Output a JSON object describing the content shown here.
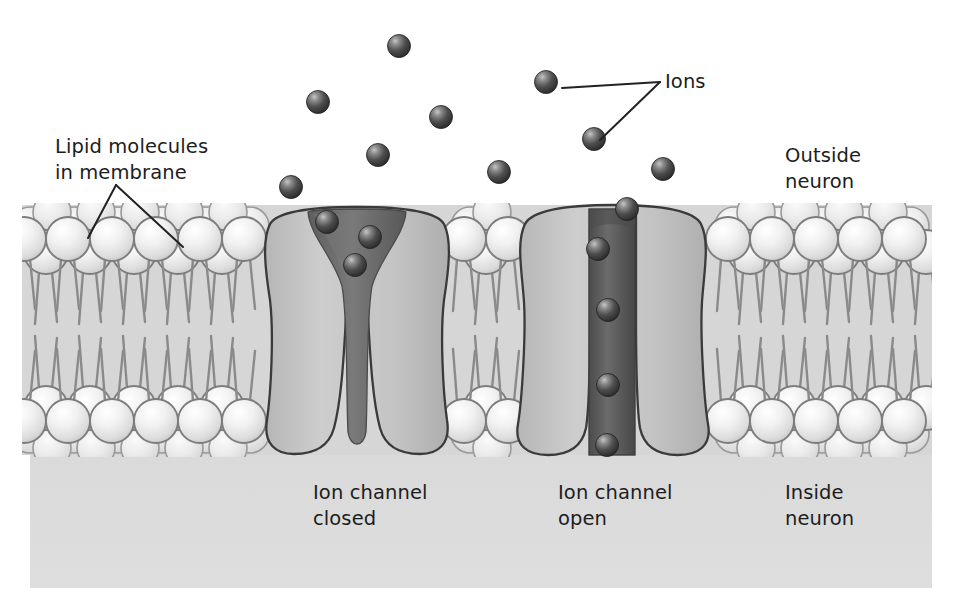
{
  "figure": {
    "canvas": {
      "width": 958,
      "height": 604
    },
    "background_color": "#ffffff"
  },
  "labels": {
    "lipid_molecules": "Lipid molecules\nin membrane",
    "ions": "Ions",
    "outside_neuron": "Outside\nneuron",
    "ion_channel_closed": "Ion channel\nclosed",
    "ion_channel_open": "Ion channel\nopen",
    "inside_neuron": "Inside\nneuron"
  },
  "colors": {
    "background": "#ffffff",
    "outside_region": "#ffffff",
    "inside_region": "#dcdcdc",
    "membrane_interior": "#d3d3d3",
    "lipid_head_light": "#f3f3f3",
    "lipid_head_shadow": "#c9c9c9",
    "lipid_head_outline": "#7d7d7d",
    "lipid_tail": "#8f8f8f",
    "channel_body": "#c2c2c2",
    "channel_outline": "#3a3a3a",
    "pore_closed": "#6e6e6e",
    "pore_open": "#5c5c5c",
    "ion_dark": "#3a3a3a",
    "ion_highlight": "#b4b4b4",
    "leader_line": "#222222",
    "text": "#1d1d1d"
  },
  "geometry": {
    "membrane_left": 22,
    "membrane_right": 932,
    "membrane_top": 205,
    "membrane_bottom": 455,
    "inside_region_top": 455,
    "inside_region_bottom": 588,
    "upper_leaflet_head_row_y": 252,
    "lower_leaflet_head_row_y": 408,
    "head_radius": 22,
    "ion_radius": 11.5
  },
  "structures": {
    "closed_channel": {
      "name": "ion channel closed",
      "center_x": 357,
      "pore_state": "closed",
      "pore_width_narrowest": 9,
      "blocked_ions_stacked_above_pore": 3
    },
    "open_channel": {
      "name": "ion channel open",
      "center_x": 613,
      "pore_state": "open",
      "pore_width": 44,
      "ions_traversing_pore": 5
    }
  },
  "ions": {
    "free_ions_outside": [
      {
        "cx": 399,
        "cy": 46
      },
      {
        "cx": 546,
        "cy": 82
      },
      {
        "cx": 318,
        "cy": 102
      },
      {
        "cx": 441,
        "cy": 117
      },
      {
        "cx": 594,
        "cy": 139
      },
      {
        "cx": 378,
        "cy": 155
      },
      {
        "cx": 499,
        "cy": 172
      },
      {
        "cx": 663,
        "cy": 169
      },
      {
        "cx": 291,
        "cy": 187
      }
    ],
    "ions_at_closed_channel": [
      {
        "cx": 327,
        "cy": 222
      },
      {
        "cx": 370,
        "cy": 237
      },
      {
        "cx": 355,
        "cy": 265
      }
    ],
    "ions_in_open_channel": [
      {
        "cx": 627,
        "cy": 209
      },
      {
        "cx": 598,
        "cy": 249
      },
      {
        "cx": 608,
        "cy": 310
      },
      {
        "cx": 608,
        "cy": 385
      },
      {
        "cx": 607,
        "cy": 445
      }
    ]
  },
  "leader_lines": {
    "lipid": [
      {
        "from": [
          116,
          185
        ],
        "to": [
          88,
          238
        ]
      },
      {
        "from": [
          116,
          185
        ],
        "to": [
          183,
          247
        ]
      }
    ],
    "ions": [
      {
        "from": [
          660,
          82
        ],
        "to": [
          562,
          88
        ]
      },
      {
        "from": [
          660,
          82
        ],
        "to": [
          600,
          140
        ]
      }
    ]
  }
}
